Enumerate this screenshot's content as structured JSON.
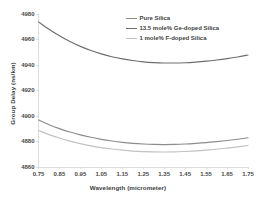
{
  "chart_data": {
    "type": "line",
    "title": "",
    "xlabel": "Wavelength (micrometer)",
    "ylabel": "Group Delay (ns/km)",
    "xlim": [
      0.75,
      1.75
    ],
    "ylim": [
      4860,
      4980
    ],
    "xticks": [
      "0.75",
      "0.85",
      "0.95",
      "1.05",
      "1.15",
      "1.25",
      "1.35",
      "1.45",
      "1.55",
      "1.65",
      "1.75"
    ],
    "yticks": [
      "4860",
      "4880",
      "4900",
      "4920",
      "4940",
      "4960",
      "4980"
    ],
    "grid": false,
    "legend_position": "top-right",
    "x": [
      0.75,
      0.8,
      0.85,
      0.9,
      0.95,
      1.0,
      1.05,
      1.1,
      1.15,
      1.2,
      1.25,
      1.3,
      1.35,
      1.4,
      1.45,
      1.5,
      1.55,
      1.6,
      1.65,
      1.7,
      1.75
    ],
    "series": [
      {
        "name": "Pure Silica",
        "color": "#8c8c8c",
        "values": [
          4896.8,
          4893.2,
          4890.1,
          4887.4,
          4885.2,
          4883.3,
          4881.7,
          4880.4,
          4879.3,
          4878.5,
          4878.0,
          4877.7,
          4877.6,
          4877.7,
          4878.0,
          4878.5,
          4879.1,
          4879.9,
          4880.8,
          4881.8,
          4882.9
        ]
      },
      {
        "name": "13.5 mole% Ge-doped Silica",
        "color": "#6e6e6e",
        "values": [
          4973.8,
          4968.0,
          4962.9,
          4958.4,
          4954.6,
          4951.4,
          4948.7,
          4946.5,
          4944.8,
          4943.5,
          4942.5,
          4941.9,
          4941.6,
          4941.6,
          4941.8,
          4942.3,
          4943.0,
          4943.9,
          4945.0,
          4946.3,
          4947.8
        ]
      },
      {
        "name": "1 mole% F-doped Silica",
        "color": "#c2c2c2",
        "values": [
          4888.6,
          4885.4,
          4882.7,
          4880.3,
          4878.3,
          4876.6,
          4875.2,
          4874.1,
          4873.2,
          4872.5,
          4872.1,
          4871.9,
          4871.8,
          4871.9,
          4872.2,
          4872.6,
          4873.2,
          4873.9,
          4874.8,
          4875.8,
          4876.9
        ]
      }
    ]
  },
  "axis": {
    "line_color": "#d0d0d0"
  }
}
